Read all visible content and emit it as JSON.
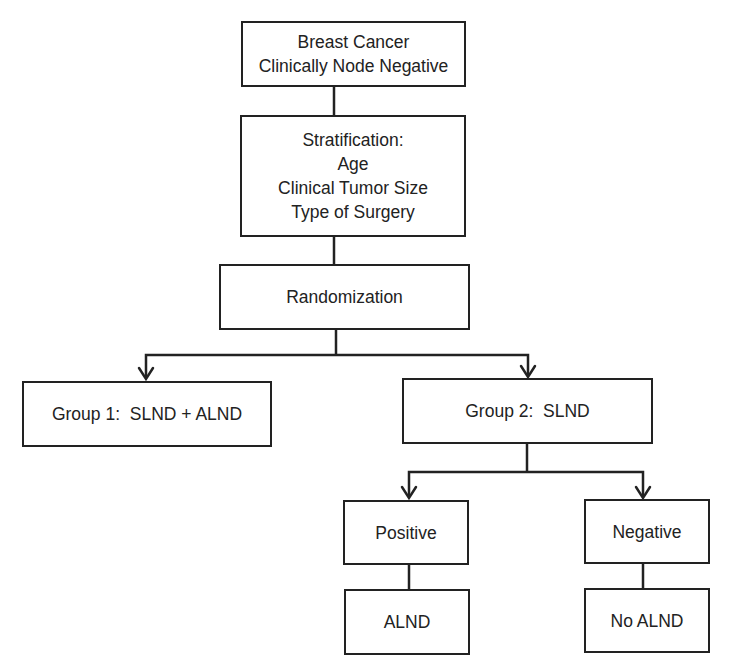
{
  "diagram": {
    "type": "flowchart",
    "nodes": {
      "population": {
        "lines": [
          "Breast Cancer",
          "Clinically Node Negative"
        ]
      },
      "stratification": {
        "lines": [
          "Stratification:",
          "Age",
          "Clinical Tumor Size",
          "Type of Surgery"
        ]
      },
      "randomization": {
        "label": "Randomization"
      },
      "group1": {
        "label": "Group 1:  SLND + ALND"
      },
      "group2": {
        "label": "Group 2:  SLND"
      },
      "positive": {
        "label": "Positive"
      },
      "negative": {
        "label": "Negative"
      },
      "alnd": {
        "label": "ALND"
      },
      "no_alnd": {
        "label": "No ALND"
      }
    },
    "edges": [
      {
        "from": "population",
        "to": "stratification",
        "arrow": false
      },
      {
        "from": "stratification",
        "to": "randomization",
        "arrow": false
      },
      {
        "from": "randomization",
        "to": "group1",
        "arrow": true
      },
      {
        "from": "randomization",
        "to": "group2",
        "arrow": true
      },
      {
        "from": "group2",
        "to": "positive",
        "arrow": true
      },
      {
        "from": "group2",
        "to": "negative",
        "arrow": true
      },
      {
        "from": "positive",
        "to": "alnd",
        "arrow": false
      },
      {
        "from": "negative",
        "to": "no_alnd",
        "arrow": false
      }
    ],
    "colors": {
      "stroke": "#222222",
      "fill": "#ffffff",
      "text": "#222222"
    }
  }
}
